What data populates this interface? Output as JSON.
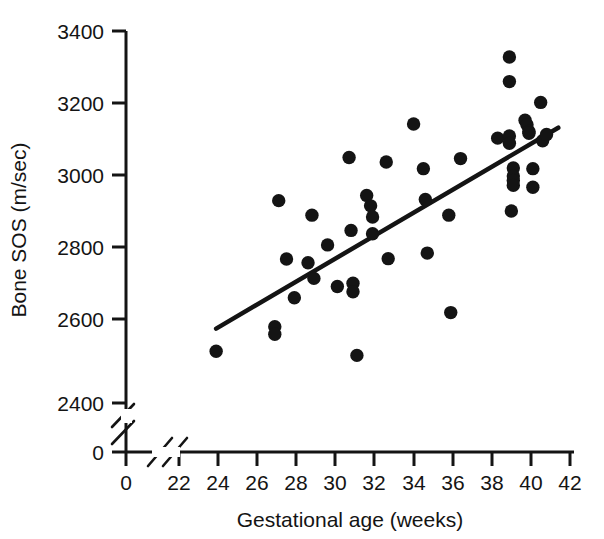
{
  "chart_data": {
    "type": "scatter",
    "title": "",
    "xlabel": "Gestational age (weeks)",
    "ylabel": "Bone SOS (m/sec)",
    "xlim": [
      22,
      42
    ],
    "ylim": [
      2400,
      3400
    ],
    "x_break": {
      "from": 0,
      "to": 22,
      "note": "axis break between 0 and 22"
    },
    "y_break": {
      "from": 0,
      "to": 2400,
      "note": "axis break between 0 and 2400"
    },
    "x_origin_tick": 0,
    "y_origin_tick": 0,
    "xticks": [
      22,
      24,
      26,
      28,
      30,
      32,
      34,
      36,
      38,
      40,
      42
    ],
    "xticklabels": [
      "22",
      "24",
      "26",
      "28",
      "30",
      "32",
      "34",
      "36",
      "38",
      "40",
      "42"
    ],
    "yticks": [
      2400,
      2600,
      2800,
      3000,
      3200,
      3400
    ],
    "yticklabels": [
      "2400",
      "2600",
      "2800",
      "3000",
      "3200",
      "3400"
    ],
    "origin_xlabel": "0",
    "origin_ylabel": "0",
    "grid": false,
    "legend": null,
    "marker": {
      "shape": "circle",
      "color": "#141414",
      "size": 9
    },
    "points": [
      {
        "x": 23.9,
        "y": 2539
      },
      {
        "x": 26.9,
        "y": 2605
      },
      {
        "x": 26.9,
        "y": 2585
      },
      {
        "x": 27.1,
        "y": 2944
      },
      {
        "x": 27.5,
        "y": 2787
      },
      {
        "x": 27.9,
        "y": 2683
      },
      {
        "x": 28.6,
        "y": 2777
      },
      {
        "x": 28.8,
        "y": 2905
      },
      {
        "x": 28.9,
        "y": 2735
      },
      {
        "x": 29.6,
        "y": 2825
      },
      {
        "x": 30.1,
        "y": 2713
      },
      {
        "x": 30.7,
        "y": 3060
      },
      {
        "x": 30.8,
        "y": 2864
      },
      {
        "x": 30.9,
        "y": 2722
      },
      {
        "x": 30.9,
        "y": 2699
      },
      {
        "x": 31.1,
        "y": 2528
      },
      {
        "x": 31.6,
        "y": 2958
      },
      {
        "x": 31.8,
        "y": 2930
      },
      {
        "x": 31.9,
        "y": 2900
      },
      {
        "x": 31.9,
        "y": 2855
      },
      {
        "x": 32.6,
        "y": 3048
      },
      {
        "x": 32.7,
        "y": 2788
      },
      {
        "x": 34.0,
        "y": 3150
      },
      {
        "x": 34.5,
        "y": 3030
      },
      {
        "x": 34.6,
        "y": 2947
      },
      {
        "x": 34.7,
        "y": 2803
      },
      {
        "x": 35.8,
        "y": 2905
      },
      {
        "x": 35.9,
        "y": 2643
      },
      {
        "x": 36.4,
        "y": 3057
      },
      {
        "x": 38.3,
        "y": 3112
      },
      {
        "x": 38.9,
        "y": 3330
      },
      {
        "x": 38.9,
        "y": 3264
      },
      {
        "x": 38.9,
        "y": 3118
      },
      {
        "x": 38.9,
        "y": 3098
      },
      {
        "x": 39.0,
        "y": 2916
      },
      {
        "x": 39.1,
        "y": 3032
      },
      {
        "x": 39.1,
        "y": 3010
      },
      {
        "x": 39.1,
        "y": 2998
      },
      {
        "x": 39.1,
        "y": 2985
      },
      {
        "x": 39.7,
        "y": 3160
      },
      {
        "x": 39.8,
        "y": 3148
      },
      {
        "x": 39.9,
        "y": 3130
      },
      {
        "x": 39.9,
        "y": 3125
      },
      {
        "x": 40.1,
        "y": 3030
      },
      {
        "x": 40.1,
        "y": 2980
      },
      {
        "x": 40.5,
        "y": 3208
      },
      {
        "x": 40.6,
        "y": 3105
      },
      {
        "x": 40.8,
        "y": 3122
      }
    ],
    "trendline": {
      "type": "linear-fit",
      "x_start": 23.9,
      "y_start": 2600,
      "x_end": 41.4,
      "y_end": 3140
    }
  }
}
